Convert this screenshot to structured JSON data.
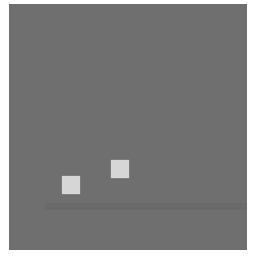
{
  "stimulus": {
    "background_color": "#6f6f6f",
    "square_color": "#d6d6d6",
    "squares": [
      {
        "label": "square-1",
        "x": 62,
        "y": 176,
        "size": 18
      },
      {
        "label": "square-2",
        "x": 111,
        "y": 160,
        "size": 18
      }
    ]
  }
}
